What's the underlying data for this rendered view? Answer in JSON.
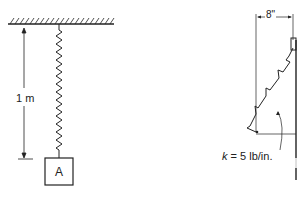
{
  "figure_left": {
    "length_label": "1 m",
    "block_label": "A"
  },
  "figure_right": {
    "width_label": "8\"",
    "k_symbol": "k",
    "k_value": " = 5 lb/in."
  },
  "colors": {
    "line": "#222222",
    "background": "#ffffff"
  }
}
